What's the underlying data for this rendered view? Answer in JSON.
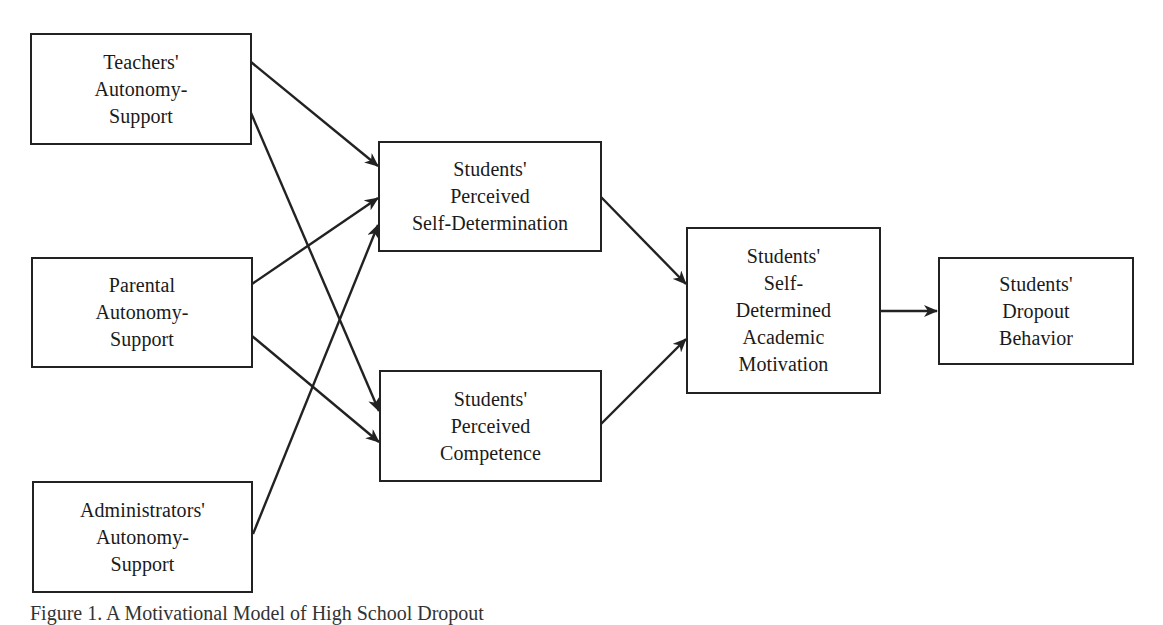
{
  "diagram": {
    "type": "path-model",
    "nodes": {
      "teachers": {
        "lines": [
          "Teachers'",
          "Autonomy-",
          "Support"
        ]
      },
      "parental": {
        "lines": [
          "Parental",
          "Autonomy-",
          "Support"
        ]
      },
      "administrators": {
        "lines": [
          "Administrators'",
          "Autonomy-",
          "Support"
        ]
      },
      "self_determination": {
        "lines": [
          "Students'",
          "Perceived",
          "Self-Determination"
        ]
      },
      "competence": {
        "lines": [
          "Students'",
          "Perceived",
          "Competence"
        ]
      },
      "motivation": {
        "lines": [
          "Students'",
          "Self-",
          "Determined",
          "Academic",
          "Motivation"
        ]
      },
      "dropout": {
        "lines": [
          "Students'",
          "Dropout",
          "Behavior"
        ]
      }
    },
    "edges": [
      {
        "from": "teachers",
        "to": "self_determination"
      },
      {
        "from": "teachers",
        "to": "competence"
      },
      {
        "from": "parental",
        "to": "self_determination"
      },
      {
        "from": "parental",
        "to": "competence"
      },
      {
        "from": "administrators",
        "to": "self_determination"
      },
      {
        "from": "self_determination",
        "to": "motivation"
      },
      {
        "from": "competence",
        "to": "motivation"
      },
      {
        "from": "motivation",
        "to": "dropout"
      }
    ],
    "caption": "Figure 1. A Motivational Model of High School Dropout"
  },
  "colors": {
    "line": "#222222",
    "background": "#ffffff"
  }
}
